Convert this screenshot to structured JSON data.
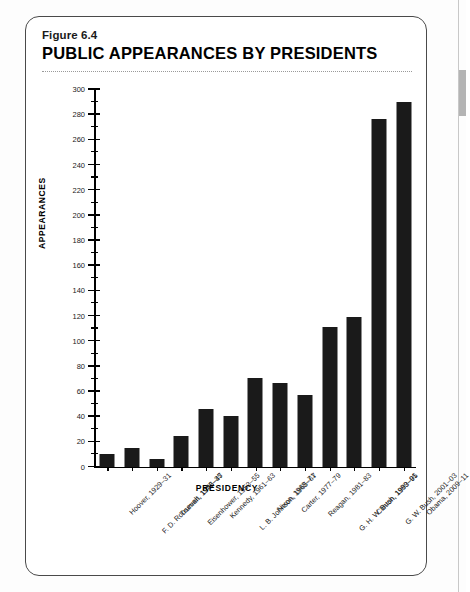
{
  "figure": {
    "number_label": "Figure 6.4",
    "title": "PUBLIC APPEARANCES BY PRESIDENTS"
  },
  "chart_data": {
    "type": "bar",
    "title": "PUBLIC APPEARANCES BY PRESIDENTS",
    "xlabel": "PRESIDENCY",
    "ylabel": "APPEARANCES",
    "ylim": [
      0,
      300
    ],
    "y_major_step": 20,
    "y_minor_step": 10,
    "grid": false,
    "legend": null,
    "bar_color": "#1a1a1a",
    "categories": [
      "Hoover, 1929–31",
      "F. D. Roosevelt, 1933–35",
      "Truman, 1945–47",
      "Eisenhower, 1953–55",
      "Kennedy, 1961–63",
      "L. B. Johnson, 1965–67",
      "Nixon, 1969–71",
      "Carter, 1977–79",
      "Reagan, 1981–83",
      "G. H. W. Bush, 1989–91",
      "Clinton, 1993–95",
      "G. W. Bush, 2001–03",
      "Obama, 2009–11"
    ],
    "values": [
      10,
      15,
      6,
      24,
      46,
      40,
      70,
      66,
      57,
      111,
      119,
      276,
      290
    ],
    "y_tick_labels": [
      "0",
      "20",
      "40",
      "60",
      "80",
      "100",
      "120",
      "140",
      "160",
      "180",
      "200",
      "220",
      "240",
      "260",
      "280",
      "300"
    ]
  }
}
